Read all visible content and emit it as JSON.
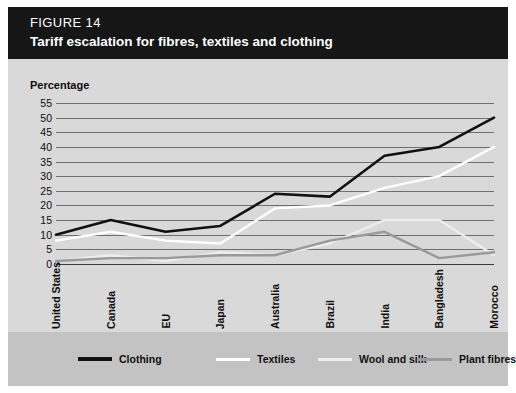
{
  "header": {
    "figure_number": "FIGURE 14",
    "title": "Tariff escalation for fibres, textiles and clothing",
    "background_color": "#161616",
    "text_color": "#ffffff"
  },
  "chart_data": {
    "type": "line",
    "title": "Tariff escalation for fibres, textiles and clothing",
    "xlabel": "",
    "ylabel": "Percentage",
    "ylim": [
      0,
      55
    ],
    "ytick_step": 5,
    "yticks": [
      "55",
      "50",
      "45",
      "40",
      "35",
      "30",
      "25",
      "20",
      "15",
      "10",
      "5",
      "0"
    ],
    "grid": true,
    "legend_position": "bottom",
    "categories": [
      "United States",
      "Canada",
      "EU",
      "Japan",
      "Australia",
      "Brazil",
      "India",
      "Bangladesh",
      "Morocco"
    ],
    "series": [
      {
        "name": "Clothing",
        "color": "#111111",
        "width": 2.6,
        "values": [
          10,
          15,
          11,
          13,
          24,
          23,
          37,
          40,
          50
        ]
      },
      {
        "name": "Textiles",
        "color": "#ffffff",
        "width": 2.4,
        "values": [
          8,
          11,
          8,
          7,
          19,
          20,
          26,
          30,
          40
        ]
      },
      {
        "name": "Wool and silk",
        "color": "#ededed",
        "width": 2.4,
        "values": [
          1,
          3,
          1,
          4,
          3,
          7,
          15,
          15,
          3
        ]
      },
      {
        "name": "Plant fibres",
        "color": "#9a9a9a",
        "width": 2.4,
        "values": [
          1,
          2,
          2,
          3,
          3,
          8,
          11,
          2,
          4
        ]
      }
    ]
  },
  "legend": {
    "items": [
      {
        "label": "Clothing",
        "color": "#111111"
      },
      {
        "label": "Textiles",
        "color": "#ffffff"
      },
      {
        "label": "Wool and silk",
        "color": "#ededed"
      },
      {
        "label": "Plant fibres",
        "color": "#9a9a9a"
      }
    ],
    "background_color": "#c3c3c3"
  },
  "colors": {
    "page_background": "#ffffff",
    "panel_background": "#d9d9d9",
    "gridline": "#6f6f6f",
    "axis": "#3a3a3a",
    "text": "#0d0d0d"
  }
}
